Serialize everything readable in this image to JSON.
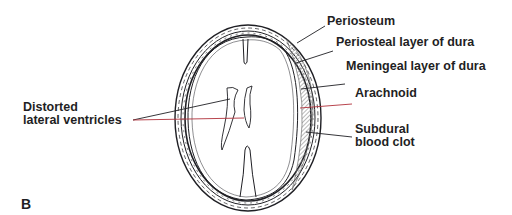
{
  "figure": {
    "panel_letter": "B",
    "labels": {
      "periosteum": "Periosteum",
      "periosteal_dura": "Periosteal layer of dura",
      "meningeal_dura": "Meningeal layer of dura",
      "arachnoid": "Arachnoid",
      "subdural_line1": "Subdural",
      "subdural_line2": "blood clot",
      "ventricles_line1": "Distorted",
      "ventricles_line2": "lateral ventricles"
    },
    "colors": {
      "ink": "#1f1f24",
      "leader_red": "#b0303a",
      "clot_hatch": "#9a9a9a",
      "background": "#ffffff"
    }
  }
}
